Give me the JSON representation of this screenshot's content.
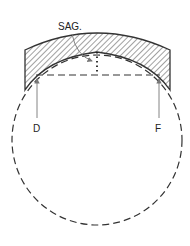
{
  "diagram": {
    "labels": {
      "sag": "SAG.",
      "left_point": "D",
      "right_point": "F"
    },
    "colors": {
      "stroke": "#333333",
      "hatch": "#444444",
      "arrow": "#777777",
      "background": "#ffffff"
    }
  }
}
